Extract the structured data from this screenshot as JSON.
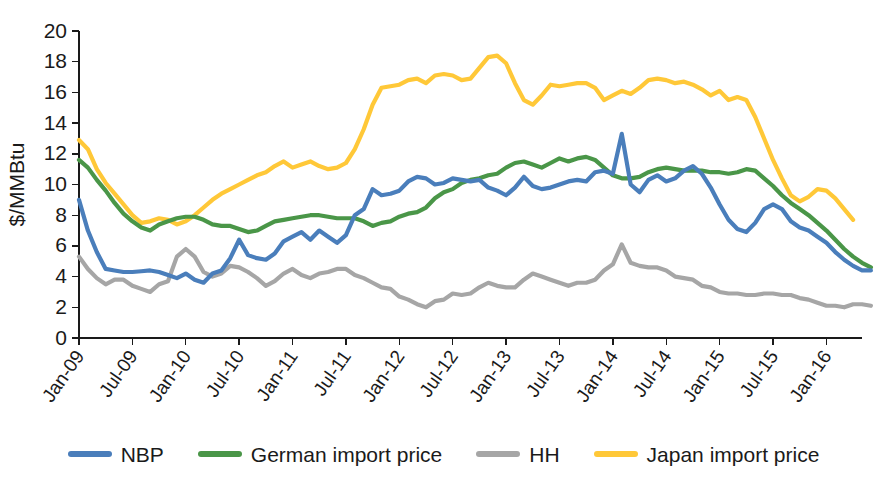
{
  "chart_data": {
    "type": "line",
    "title": "",
    "xlabel": "",
    "ylabel": "$/MMBtu",
    "ylim": [
      0,
      20
    ],
    "ytick_values": [
      0,
      2,
      4,
      6,
      8,
      10,
      12,
      14,
      16,
      18,
      20
    ],
    "grid": false,
    "legend_position": "bottom",
    "x_start": "Jan-09",
    "x_end": "Mar-16",
    "x_step_months": 1,
    "tick_labels": [
      "Jan-09",
      "Jul-09",
      "Jan-10",
      "Jul-10",
      "Jan-11",
      "Jul-11",
      "Jan-12",
      "Jul-12",
      "Jan-13",
      "Jul-13",
      "Jan-14",
      "Jul-14",
      "Jan-15",
      "Jul-15",
      "Jan-16"
    ],
    "tick_step_months": 6,
    "series": [
      {
        "name": "NBP",
        "color": "#4A7EBB",
        "values": [
          9.0,
          7.0,
          5.6,
          4.5,
          4.4,
          4.3,
          4.3,
          4.35,
          4.4,
          4.3,
          4.1,
          3.9,
          4.2,
          3.8,
          3.6,
          4.2,
          4.4,
          5.2,
          6.4,
          5.4,
          5.2,
          5.1,
          5.5,
          6.3,
          6.6,
          6.9,
          6.4,
          7.0,
          6.6,
          6.2,
          6.7,
          8.0,
          8.4,
          9.7,
          9.3,
          9.4,
          9.6,
          10.2,
          10.5,
          10.4,
          10.0,
          10.1,
          10.4,
          10.3,
          10.2,
          10.3,
          9.8,
          9.6,
          9.3,
          9.8,
          10.5,
          9.9,
          9.7,
          9.8,
          10.0,
          10.2,
          10.3,
          10.2,
          10.8,
          10.9,
          10.7,
          13.3,
          10.0,
          9.5,
          10.3,
          10.6,
          10.2,
          10.4,
          10.9,
          11.2,
          10.7,
          9.8,
          8.7,
          7.7,
          7.1,
          6.9,
          7.5,
          8.4,
          8.7,
          8.4,
          7.6,
          7.2,
          7.0,
          6.6,
          6.2,
          5.6,
          5.1,
          4.7,
          4.4,
          4.4
        ]
      },
      {
        "name": "German import price",
        "color": "#4A9648",
        "values": [
          11.6,
          11.1,
          10.3,
          9.6,
          8.8,
          8.1,
          7.6,
          7.2,
          7.0,
          7.4,
          7.6,
          7.8,
          7.9,
          7.9,
          7.7,
          7.4,
          7.3,
          7.3,
          7.1,
          6.9,
          7.0,
          7.3,
          7.6,
          7.7,
          7.8,
          7.9,
          8.0,
          8.0,
          7.9,
          7.8,
          7.8,
          7.8,
          7.6,
          7.3,
          7.5,
          7.6,
          7.9,
          8.1,
          8.2,
          8.5,
          9.1,
          9.5,
          9.7,
          10.1,
          10.3,
          10.4,
          10.6,
          10.7,
          11.1,
          11.4,
          11.5,
          11.3,
          11.1,
          11.4,
          11.7,
          11.5,
          11.7,
          11.8,
          11.6,
          11.1,
          10.6,
          10.4,
          10.4,
          10.5,
          10.8,
          11.0,
          11.1,
          11.0,
          10.9,
          10.9,
          10.9,
          10.8,
          10.8,
          10.7,
          10.8,
          11.0,
          10.9,
          10.4,
          9.9,
          9.3,
          8.8,
          8.4,
          8.0,
          7.5,
          7.0,
          6.4,
          5.8,
          5.3,
          4.9,
          4.6
        ]
      },
      {
        "name": "HH",
        "color": "#A6A6A6",
        "values": [
          5.3,
          4.5,
          3.9,
          3.5,
          3.8,
          3.8,
          3.4,
          3.2,
          3.0,
          3.5,
          3.7,
          5.3,
          5.8,
          5.3,
          4.3,
          4.0,
          4.2,
          4.7,
          4.6,
          4.3,
          3.9,
          3.4,
          3.7,
          4.2,
          4.5,
          4.1,
          3.9,
          4.2,
          4.3,
          4.5,
          4.5,
          4.1,
          3.9,
          3.6,
          3.3,
          3.2,
          2.7,
          2.5,
          2.2,
          2.0,
          2.4,
          2.5,
          2.9,
          2.8,
          2.9,
          3.3,
          3.6,
          3.4,
          3.3,
          3.3,
          3.8,
          4.2,
          4.0,
          3.8,
          3.6,
          3.4,
          3.6,
          3.6,
          3.8,
          4.4,
          4.8,
          6.1,
          4.9,
          4.7,
          4.6,
          4.6,
          4.4,
          4.0,
          3.9,
          3.8,
          3.4,
          3.3,
          3.0,
          2.9,
          2.9,
          2.8,
          2.8,
          2.9,
          2.9,
          2.8,
          2.8,
          2.6,
          2.5,
          2.3,
          2.1,
          2.1,
          2.0,
          2.2,
          2.2,
          2.1
        ]
      },
      {
        "name": "Japan import price",
        "color": "#FFC838",
        "values": [
          12.9,
          12.3,
          11.0,
          10.1,
          9.4,
          8.7,
          8.0,
          7.5,
          7.6,
          7.8,
          7.7,
          7.4,
          7.6,
          8.0,
          8.5,
          9.0,
          9.4,
          9.7,
          10.0,
          10.3,
          10.6,
          10.8,
          11.2,
          11.5,
          11.1,
          11.3,
          11.5,
          11.2,
          11.0,
          11.1,
          11.4,
          12.3,
          13.6,
          15.2,
          16.3,
          16.4,
          16.5,
          16.8,
          16.9,
          16.6,
          17.1,
          17.2,
          17.1,
          16.8,
          16.9,
          17.6,
          18.3,
          18.4,
          17.9,
          16.6,
          15.5,
          15.2,
          15.8,
          16.5,
          16.4,
          16.5,
          16.6,
          16.6,
          16.3,
          15.5,
          15.8,
          16.1,
          15.9,
          16.3,
          16.8,
          16.9,
          16.8,
          16.6,
          16.7,
          16.5,
          16.2,
          15.8,
          16.1,
          15.5,
          15.7,
          15.5,
          14.4,
          13.0,
          11.6,
          10.4,
          9.3,
          8.9,
          9.2,
          9.7,
          9.6,
          9.1,
          8.4,
          7.7
        ]
      }
    ]
  },
  "axis": {
    "ylabel": "$/MMBtu",
    "ytick_labels": [
      "20",
      "18",
      "16",
      "14",
      "12",
      "10",
      "8",
      "6",
      "4",
      "2",
      "0"
    ],
    "xtick_labels": [
      "Jan-09",
      "Jul-09",
      "Jan-10",
      "Jul-10",
      "Jan-11",
      "Jul-11",
      "Jan-12",
      "Jul-12",
      "Jan-13",
      "Jul-13",
      "Jan-14",
      "Jul-14",
      "Jan-15",
      "Jul-15",
      "Jan-16"
    ]
  },
  "legend": {
    "items": [
      {
        "label": "NBP",
        "color": "#4A7EBB"
      },
      {
        "label": "German import price",
        "color": "#4A9648"
      },
      {
        "label": "HH",
        "color": "#A6A6A6"
      },
      {
        "label": "Japan import price",
        "color": "#FFC838"
      }
    ]
  }
}
